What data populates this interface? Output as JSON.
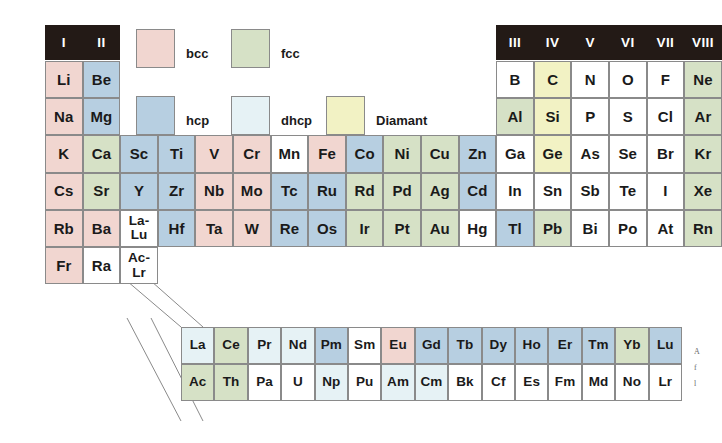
{
  "figure": {
    "margin_caption_lines": [
      "A",
      "f",
      "l"
    ]
  },
  "legend": {
    "items": [
      {
        "key": "bcc",
        "label": "bcc",
        "color": "#f1d6d0"
      },
      {
        "key": "fcc",
        "label": "fcc",
        "color": "#d6e1c6"
      },
      {
        "key": "hcp",
        "label": "hcp",
        "color": "#b7cfe1"
      },
      {
        "key": "dhcp",
        "label": "dhcp",
        "color": "#e6f2f5"
      },
      {
        "key": "diamant",
        "label": "Diamant",
        "color": "#f2f2c4"
      },
      {
        "key": "none",
        "label": "",
        "color": "#ffffff"
      }
    ]
  },
  "group_headers": {
    "left": [
      "I",
      "II"
    ],
    "right": [
      "III",
      "IV",
      "V",
      "VI",
      "VII",
      "VIII"
    ]
  },
  "chart_data": {
    "type": "table",
    "legend_position": "top-center",
    "categories": [
      "bcc",
      "fcc",
      "hcp",
      "dhcp",
      "Diamant",
      "none"
    ],
    "elements": [
      {
        "symbol": "Li",
        "structure": "bcc",
        "row": 1,
        "col": 1
      },
      {
        "symbol": "Be",
        "structure": "hcp",
        "row": 1,
        "col": 2
      },
      {
        "symbol": "B",
        "structure": "none",
        "row": 1,
        "col": 13
      },
      {
        "symbol": "C",
        "structure": "diamant",
        "row": 1,
        "col": 14
      },
      {
        "symbol": "N",
        "structure": "none",
        "row": 1,
        "col": 15
      },
      {
        "symbol": "O",
        "structure": "none",
        "row": 1,
        "col": 16
      },
      {
        "symbol": "F",
        "structure": "none",
        "row": 1,
        "col": 17
      },
      {
        "symbol": "Ne",
        "structure": "fcc",
        "row": 1,
        "col": 18
      },
      {
        "symbol": "Na",
        "structure": "bcc",
        "row": 2,
        "col": 1
      },
      {
        "symbol": "Mg",
        "structure": "hcp",
        "row": 2,
        "col": 2
      },
      {
        "symbol": "Al",
        "structure": "fcc",
        "row": 2,
        "col": 13
      },
      {
        "symbol": "Si",
        "structure": "diamant",
        "row": 2,
        "col": 14
      },
      {
        "symbol": "P",
        "structure": "none",
        "row": 2,
        "col": 15
      },
      {
        "symbol": "S",
        "structure": "none",
        "row": 2,
        "col": 16
      },
      {
        "symbol": "Cl",
        "structure": "none",
        "row": 2,
        "col": 17
      },
      {
        "symbol": "Ar",
        "structure": "fcc",
        "row": 2,
        "col": 18
      },
      {
        "symbol": "K",
        "structure": "bcc",
        "row": 3,
        "col": 1
      },
      {
        "symbol": "Ca",
        "structure": "fcc",
        "row": 3,
        "col": 2
      },
      {
        "symbol": "Sc",
        "structure": "hcp",
        "row": 3,
        "col": 3
      },
      {
        "symbol": "Ti",
        "structure": "hcp",
        "row": 3,
        "col": 4
      },
      {
        "symbol": "V",
        "structure": "bcc",
        "row": 3,
        "col": 5
      },
      {
        "symbol": "Cr",
        "structure": "bcc",
        "row": 3,
        "col": 6
      },
      {
        "symbol": "Mn",
        "structure": "none",
        "row": 3,
        "col": 7
      },
      {
        "symbol": "Fe",
        "structure": "bcc",
        "row": 3,
        "col": 8
      },
      {
        "symbol": "Co",
        "structure": "hcp",
        "row": 3,
        "col": 9
      },
      {
        "symbol": "Ni",
        "structure": "fcc",
        "row": 3,
        "col": 10
      },
      {
        "symbol": "Cu",
        "structure": "fcc",
        "row": 3,
        "col": 11
      },
      {
        "symbol": "Zn",
        "structure": "hcp",
        "row": 3,
        "col": 12
      },
      {
        "symbol": "Ga",
        "structure": "none",
        "row": 3,
        "col": 13
      },
      {
        "symbol": "Ge",
        "structure": "diamant",
        "row": 3,
        "col": 14
      },
      {
        "symbol": "As",
        "structure": "none",
        "row": 3,
        "col": 15
      },
      {
        "symbol": "Se",
        "structure": "none",
        "row": 3,
        "col": 16
      },
      {
        "symbol": "Br",
        "structure": "none",
        "row": 3,
        "col": 17
      },
      {
        "symbol": "Kr",
        "structure": "fcc",
        "row": 3,
        "col": 18
      },
      {
        "symbol": "Cs",
        "structure": "bcc",
        "row": 4,
        "col": 1
      },
      {
        "symbol": "Sr",
        "structure": "fcc",
        "row": 4,
        "col": 2
      },
      {
        "symbol": "Y",
        "structure": "hcp",
        "row": 4,
        "col": 3
      },
      {
        "symbol": "Zr",
        "structure": "hcp",
        "row": 4,
        "col": 4
      },
      {
        "symbol": "Nb",
        "structure": "bcc",
        "row": 4,
        "col": 5
      },
      {
        "symbol": "Mo",
        "structure": "bcc",
        "row": 4,
        "col": 6
      },
      {
        "symbol": "Tc",
        "structure": "hcp",
        "row": 4,
        "col": 7
      },
      {
        "symbol": "Ru",
        "structure": "hcp",
        "row": 4,
        "col": 8
      },
      {
        "symbol": "Rd",
        "structure": "fcc",
        "row": 4,
        "col": 9
      },
      {
        "symbol": "Pd",
        "structure": "fcc",
        "row": 4,
        "col": 10
      },
      {
        "symbol": "Ag",
        "structure": "fcc",
        "row": 4,
        "col": 11
      },
      {
        "symbol": "Cd",
        "structure": "hcp",
        "row": 4,
        "col": 12
      },
      {
        "symbol": "In",
        "structure": "none",
        "row": 4,
        "col": 13
      },
      {
        "symbol": "Sn",
        "structure": "none",
        "row": 4,
        "col": 14
      },
      {
        "symbol": "Sb",
        "structure": "none",
        "row": 4,
        "col": 15
      },
      {
        "symbol": "Te",
        "structure": "none",
        "row": 4,
        "col": 16
      },
      {
        "symbol": "I",
        "structure": "none",
        "row": 4,
        "col": 17
      },
      {
        "symbol": "Xe",
        "structure": "fcc",
        "row": 4,
        "col": 18
      },
      {
        "symbol": "Rb",
        "structure": "bcc",
        "row": 5,
        "col": 1
      },
      {
        "symbol": "Ba",
        "structure": "bcc",
        "row": 5,
        "col": 2
      },
      {
        "symbol": "La-Lu",
        "structure": "none",
        "row": 5,
        "col": 3
      },
      {
        "symbol": "Hf",
        "structure": "hcp",
        "row": 5,
        "col": 4
      },
      {
        "symbol": "Ta",
        "structure": "bcc",
        "row": 5,
        "col": 5
      },
      {
        "symbol": "W",
        "structure": "bcc",
        "row": 5,
        "col": 6
      },
      {
        "symbol": "Re",
        "structure": "hcp",
        "row": 5,
        "col": 7
      },
      {
        "symbol": "Os",
        "structure": "hcp",
        "row": 5,
        "col": 8
      },
      {
        "symbol": "Ir",
        "structure": "fcc",
        "row": 5,
        "col": 9
      },
      {
        "symbol": "Pt",
        "structure": "fcc",
        "row": 5,
        "col": 10
      },
      {
        "symbol": "Au",
        "structure": "fcc",
        "row": 5,
        "col": 11
      },
      {
        "symbol": "Hg",
        "structure": "none",
        "row": 5,
        "col": 12
      },
      {
        "symbol": "Tl",
        "structure": "hcp",
        "row": 5,
        "col": 13
      },
      {
        "symbol": "Pb",
        "structure": "fcc",
        "row": 5,
        "col": 14
      },
      {
        "symbol": "Bi",
        "structure": "none",
        "row": 5,
        "col": 15
      },
      {
        "symbol": "Po",
        "structure": "none",
        "row": 5,
        "col": 16
      },
      {
        "symbol": "At",
        "structure": "none",
        "row": 5,
        "col": 17
      },
      {
        "symbol": "Rn",
        "structure": "fcc",
        "row": 5,
        "col": 18
      },
      {
        "symbol": "Fr",
        "structure": "bcc",
        "row": 6,
        "col": 1
      },
      {
        "symbol": "Ra",
        "structure": "none",
        "row": 6,
        "col": 2
      },
      {
        "symbol": "Ac-Lr",
        "structure": "none",
        "row": 6,
        "col": 3
      }
    ],
    "lanthanides": [
      {
        "symbol": "La",
        "structure": "dhcp"
      },
      {
        "symbol": "Ce",
        "structure": "fcc"
      },
      {
        "symbol": "Pr",
        "structure": "dhcp"
      },
      {
        "symbol": "Nd",
        "structure": "dhcp"
      },
      {
        "symbol": "Pm",
        "structure": "hcp"
      },
      {
        "symbol": "Sm",
        "structure": "none"
      },
      {
        "symbol": "Eu",
        "structure": "bcc"
      },
      {
        "symbol": "Gd",
        "structure": "hcp"
      },
      {
        "symbol": "Tb",
        "structure": "hcp"
      },
      {
        "symbol": "Dy",
        "structure": "hcp"
      },
      {
        "symbol": "Ho",
        "structure": "hcp"
      },
      {
        "symbol": "Er",
        "structure": "hcp"
      },
      {
        "symbol": "Tm",
        "structure": "hcp"
      },
      {
        "symbol": "Yb",
        "structure": "fcc"
      },
      {
        "symbol": "Lu",
        "structure": "hcp"
      }
    ],
    "actinides": [
      {
        "symbol": "Ac",
        "structure": "fcc"
      },
      {
        "symbol": "Th",
        "structure": "fcc"
      },
      {
        "symbol": "Pa",
        "structure": "none"
      },
      {
        "symbol": "U",
        "structure": "none"
      },
      {
        "symbol": "Np",
        "structure": "dhcp"
      },
      {
        "symbol": "Pu",
        "structure": "none"
      },
      {
        "symbol": "Am",
        "structure": "dhcp"
      },
      {
        "symbol": "Cm",
        "structure": "dhcp"
      },
      {
        "symbol": "Bk",
        "structure": "none"
      },
      {
        "symbol": "Cf",
        "structure": "none"
      },
      {
        "symbol": "Es",
        "structure": "none"
      },
      {
        "symbol": "Fm",
        "structure": "none"
      },
      {
        "symbol": "Md",
        "structure": "none"
      },
      {
        "symbol": "No",
        "structure": "none"
      },
      {
        "symbol": "Lr",
        "structure": "none"
      }
    ]
  }
}
